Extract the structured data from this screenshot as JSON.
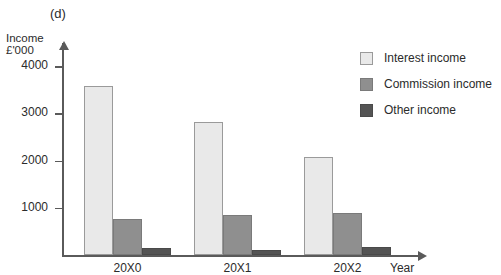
{
  "panel": {
    "label": "(d)"
  },
  "axis": {
    "y_title_line1": "Income",
    "y_title_line2": "£'000",
    "x_title": "Year"
  },
  "legend": {
    "items": [
      {
        "label": "Interest income",
        "color": "#e9e9e9",
        "key": "interest"
      },
      {
        "label": "Commission income",
        "color": "#8f8f8f",
        "key": "commission"
      },
      {
        "label": "Other income",
        "color": "#545454",
        "key": "other"
      }
    ]
  },
  "chart_data": {
    "type": "bar",
    "title": "(d)",
    "xlabel": "Year",
    "ylabel": "Income £'000",
    "categories": [
      "20X0",
      "20X1",
      "20X2"
    ],
    "ylim": [
      0,
      4600
    ],
    "yticks": [
      1000,
      2000,
      3000,
      4000
    ],
    "ytick_labels": [
      "1000",
      "2000",
      "3000",
      "4000"
    ],
    "grid": false,
    "legend_position": "right",
    "series": [
      {
        "name": "Interest income",
        "color": "#e9e9e9",
        "values": [
          3580,
          2820,
          2080
        ]
      },
      {
        "name": "Commission income",
        "color": "#8f8f8f",
        "values": [
          770,
          840,
          890
        ]
      },
      {
        "name": "Other income",
        "color": "#545454",
        "values": [
          140,
          110,
          180
        ]
      }
    ]
  }
}
